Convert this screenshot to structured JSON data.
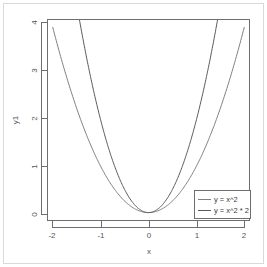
{
  "chart_data": {
    "type": "line",
    "title": "",
    "subtitle": "",
    "xlabel": "x",
    "ylabel": "y1",
    "xlim": [
      -2.1,
      2.1
    ],
    "ylim": [
      -0.16,
      4.16
    ],
    "grid": false,
    "legend_position": "bottom-right",
    "x_ticks": [
      "-2",
      "-1",
      "0",
      "1",
      "2"
    ],
    "x_tick_values": [
      -2,
      -1,
      0,
      1,
      2
    ],
    "y_ticks": [
      "0",
      "1",
      "2",
      "3",
      "4"
    ],
    "y_tick_values": [
      0,
      1,
      2,
      3,
      4
    ],
    "series": [
      {
        "name": "y = x^2",
        "color": "#808080",
        "formula": "x^2",
        "x": [
          -2,
          -1.8,
          -1.6,
          -1.4,
          -1.2,
          -1,
          -0.8,
          -0.6,
          -0.4,
          -0.2,
          0,
          0.2,
          0.4,
          0.6,
          0.8,
          1,
          1.2,
          1.4,
          1.6,
          1.8,
          2
        ],
        "values": [
          4,
          3.24,
          2.56,
          1.96,
          1.44,
          1,
          0.64,
          0.36,
          0.16,
          0.04,
          0,
          0.04,
          0.16,
          0.36,
          0.64,
          1,
          1.44,
          1.96,
          2.56,
          3.24,
          4
        ]
      },
      {
        "name": "y = x^2 * 2",
        "color": "#5a5a5a",
        "formula": "x^2 * 2",
        "x": [
          -1.45,
          -1.4,
          -1.2,
          -1,
          -0.8,
          -0.6,
          -0.4,
          -0.2,
          0,
          0.2,
          0.4,
          0.6,
          0.8,
          1,
          1.2,
          1.4,
          1.45
        ],
        "values": [
          4.205,
          3.92,
          2.88,
          2,
          1.28,
          0.72,
          0.32,
          0.08,
          0,
          0.08,
          0.32,
          0.72,
          1.28,
          2,
          2.88,
          3.92,
          4.205
        ]
      }
    ]
  },
  "legend": {
    "entries": [
      {
        "label": "y = x^2"
      },
      {
        "label": "y = x^2 * 2"
      }
    ]
  },
  "axes": {
    "x_title": "x",
    "y_title": "y1",
    "x_tick_labels": [
      "-2",
      "-1",
      "0",
      "1",
      "2"
    ],
    "y_tick_labels": [
      "4",
      "3",
      "2",
      "1",
      "0"
    ]
  },
  "colors": {
    "axis": "#6e6e6e",
    "text": "#555555",
    "frame": "#d9d9d9",
    "series_1": "#808080",
    "series_2": "#5a5a5a",
    "background": "#ffffff"
  }
}
